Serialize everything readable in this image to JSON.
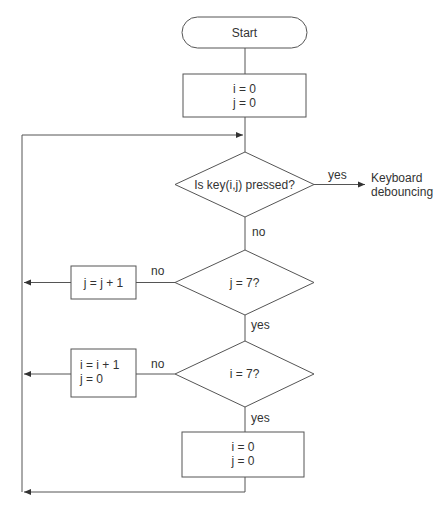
{
  "diagram": {
    "nodes": {
      "start": {
        "label": "Start"
      },
      "init": {
        "line1": "i = 0",
        "line2": "j = 0"
      },
      "decision_key": {
        "label": "Is key(i,j) pressed?"
      },
      "debounce": {
        "line1": "Keyboard",
        "line2": "debouncing"
      },
      "decision_j": {
        "label": "j = 7?"
      },
      "inc_j": {
        "label": "j = j + 1"
      },
      "decision_i": {
        "label": "i = 7?"
      },
      "inc_i": {
        "line1": "i = i + 1",
        "line2": "j = 0"
      },
      "reset": {
        "line1": "i = 0",
        "line2": "j = 0"
      }
    },
    "edges": {
      "key_yes": "yes",
      "key_no": "no",
      "j_no": "no",
      "j_yes": "yes",
      "i_no": "no",
      "i_yes": "yes"
    }
  }
}
